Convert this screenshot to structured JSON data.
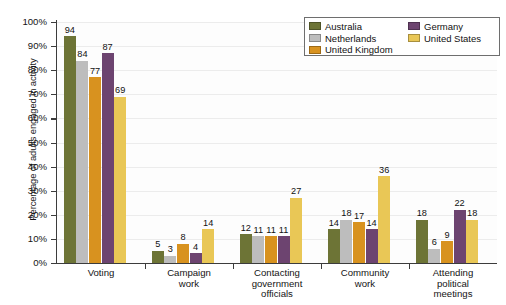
{
  "chart_data": {
    "type": "bar",
    "title": "",
    "xlabel": "",
    "ylabel": "Percentage of adults engaged in activity",
    "ylim": [
      0,
      100
    ],
    "ytick_labels": [
      "0%",
      "10%",
      "20%",
      "30%",
      "40%",
      "50%",
      "60%",
      "70%",
      "80%",
      "90%",
      "100%"
    ],
    "ytick_values": [
      0,
      10,
      20,
      30,
      40,
      50,
      60,
      70,
      80,
      90,
      100
    ],
    "grid": true,
    "legend_position": "top-right",
    "value_labels": true,
    "categories": [
      "Voting",
      "Campaign work",
      "Contacting government officials",
      "Community work",
      "Attending political meetings"
    ],
    "category_lines": [
      [
        "Voting"
      ],
      [
        "Campaign",
        "work"
      ],
      [
        "Contacting",
        "government",
        "officials"
      ],
      [
        "Community",
        "work"
      ],
      [
        "Attending",
        "political",
        "meetings"
      ]
    ],
    "series": [
      {
        "name": "Australia",
        "color": "#6d7436",
        "values": [
          94,
          5,
          12,
          14,
          18
        ]
      },
      {
        "name": "Netherlands",
        "color": "#bdbdbd",
        "values": [
          84,
          3,
          11,
          18,
          6
        ]
      },
      {
        "name": "United Kingdom",
        "color": "#d8921f",
        "values": [
          77,
          8,
          11,
          17,
          9
        ]
      },
      {
        "name": "Germany",
        "color": "#6d4470",
        "values": [
          87,
          4,
          11,
          14,
          22
        ]
      },
      {
        "name": "United States",
        "color": "#e9c756",
        "values": [
          69,
          14,
          27,
          36,
          18
        ]
      }
    ]
  },
  "legend": {
    "columns": [
      [
        "Australia",
        "Netherlands",
        "United Kingdom"
      ],
      [
        "Germany",
        "United States"
      ]
    ]
  }
}
